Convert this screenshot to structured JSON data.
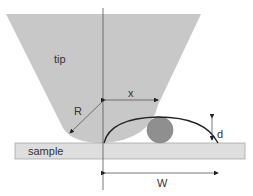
{
  "diagram": {
    "labels": {
      "tip": "tip",
      "sample": "sample",
      "radius": "R",
      "x": "x",
      "d": "d",
      "w": "W"
    },
    "colors": {
      "tip_fill": "#c8c8c8",
      "sample_fill": "#dedede",
      "sample_stroke": "#a8a8a8",
      "particle_fill": "#8f8f8f",
      "line": "#222222",
      "axis": "#555555"
    }
  }
}
